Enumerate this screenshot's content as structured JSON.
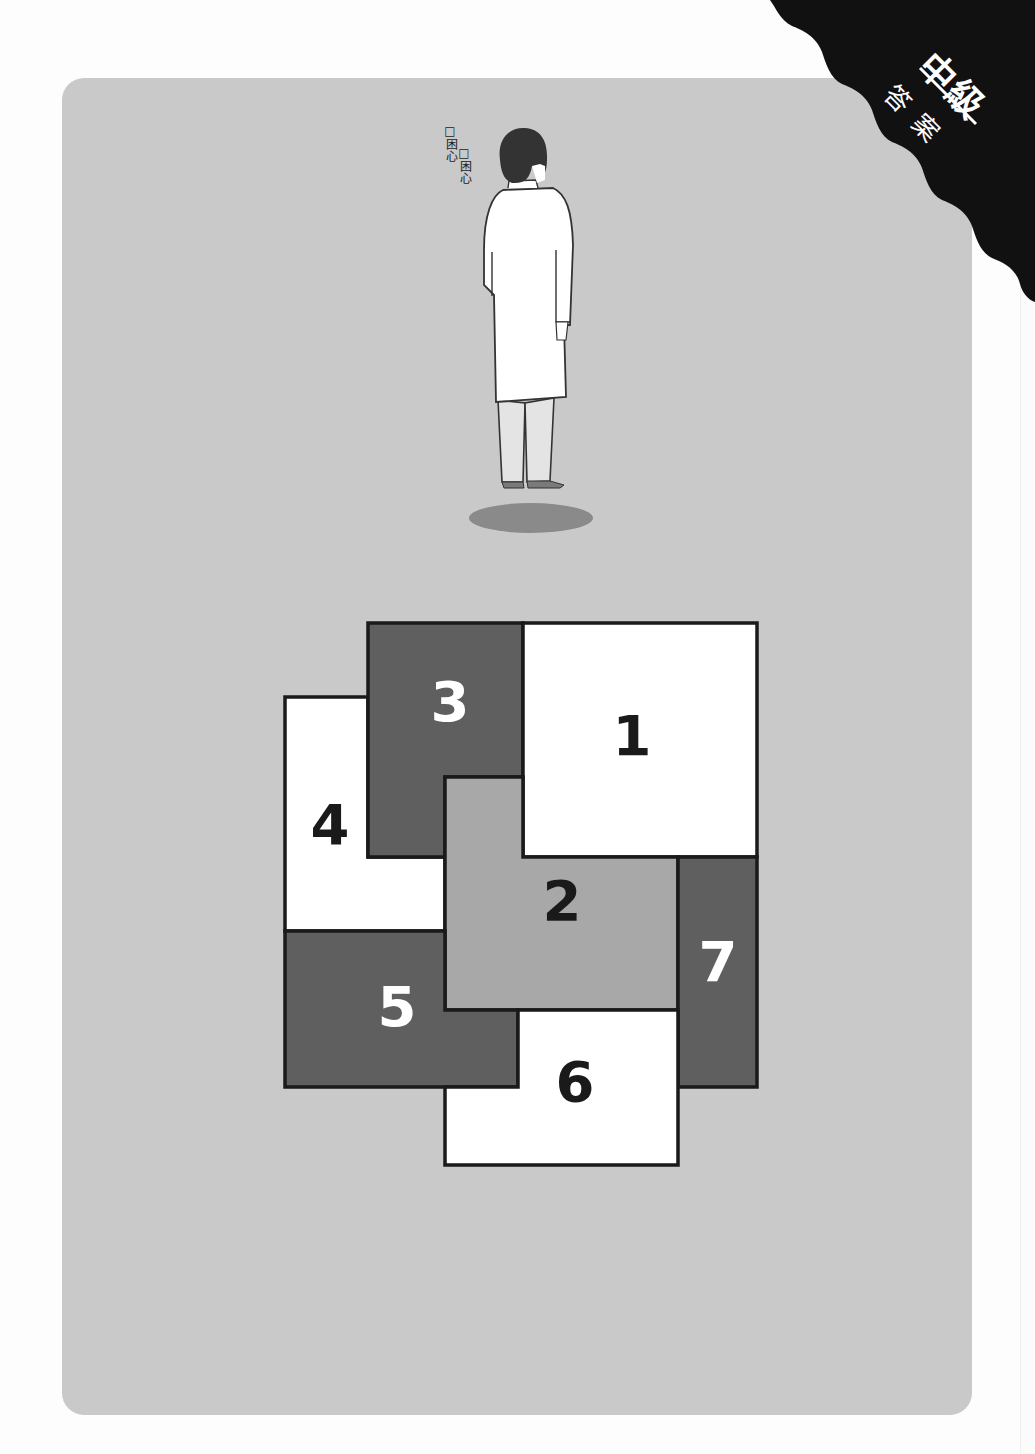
{
  "corner_tag": {
    "level": "中級",
    "subtitle": "答案",
    "background_color": "#111111",
    "text_color": "#ffffff"
  },
  "card": {
    "background_color": "#c9c9c9"
  },
  "character": {
    "thought_sound": [
      "□困心",
      "□困心"
    ],
    "description": "man in white lab coat viewed from behind, floating above shadow"
  },
  "puzzle": {
    "colors": {
      "dark": "#5f5f5f",
      "light": "#a8a8a8",
      "white": "#ffffff",
      "outline": "#1a1a1a"
    },
    "pieces": [
      {
        "id": "1",
        "label": "1",
        "fill": "white",
        "label_color": "#1a1a1a"
      },
      {
        "id": "2",
        "label": "2",
        "fill": "light",
        "label_color": "#1a1a1a"
      },
      {
        "id": "3",
        "label": "3",
        "fill": "dark",
        "label_color": "#ffffff"
      },
      {
        "id": "4",
        "label": "4",
        "fill": "white",
        "label_color": "#1a1a1a"
      },
      {
        "id": "5",
        "label": "5",
        "fill": "dark",
        "label_color": "#ffffff"
      },
      {
        "id": "6",
        "label": "6",
        "fill": "white",
        "label_color": "#1a1a1a"
      },
      {
        "id": "7",
        "label": "7",
        "fill": "dark",
        "label_color": "#ffffff"
      }
    ]
  }
}
